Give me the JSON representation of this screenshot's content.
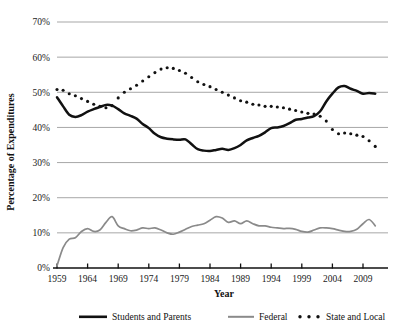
{
  "chart_data": {
    "type": "line",
    "title": "",
    "xlabel": "Year",
    "ylabel": "Percentage of Expenditures",
    "xlim": [
      1959,
      2012
    ],
    "ylim": [
      0,
      70
    ],
    "ytick_labels": [
      "0%",
      "10%",
      "20%",
      "30%",
      "40%",
      "50%",
      "60%",
      "70%"
    ],
    "ytick_values": [
      0,
      10,
      20,
      30,
      40,
      50,
      60,
      70
    ],
    "xtick_labels": [
      "1959",
      "1964",
      "1969",
      "1974",
      "1979",
      "1984",
      "1989",
      "1994",
      "1999",
      "2004",
      "2009"
    ],
    "xtick_values": [
      1959,
      1964,
      1969,
      1974,
      1979,
      1984,
      1989,
      1994,
      1999,
      2004,
      2009
    ],
    "grid": "horizontal",
    "legend_position": "bottom",
    "x": [
      1959,
      1960,
      1961,
      1962,
      1963,
      1964,
      1965,
      1966,
      1967,
      1968,
      1969,
      1970,
      1971,
      1972,
      1973,
      1974,
      1975,
      1976,
      1977,
      1978,
      1979,
      1980,
      1981,
      1982,
      1983,
      1984,
      1985,
      1986,
      1987,
      1988,
      1989,
      1990,
      1991,
      1992,
      1993,
      1994,
      1995,
      1996,
      1997,
      1998,
      1999,
      2000,
      2001,
      2002,
      2003,
      2004,
      2005,
      2006,
      2007,
      2008,
      2009,
      2010,
      2011
    ],
    "series": [
      {
        "name": "Students and Parents",
        "color": "#111111",
        "style": "solid",
        "values": [
          48.6,
          46.0,
          43.6,
          43.0,
          43.5,
          44.5,
          45.2,
          45.8,
          46.4,
          46.2,
          45.2,
          44.0,
          43.3,
          42.5,
          41.0,
          39.8,
          38.2,
          37.2,
          36.8,
          36.6,
          36.5,
          36.6,
          35.2,
          33.8,
          33.4,
          33.3,
          33.6,
          33.9,
          33.6,
          34.1,
          35.0,
          36.3,
          37.0,
          37.6,
          38.6,
          39.8,
          40.0,
          40.4,
          41.2,
          42.2,
          42.4,
          42.8,
          43.2,
          44.6,
          47.4,
          49.6,
          51.4,
          51.8,
          51.0,
          50.4,
          49.6,
          49.8,
          49.6
        ]
      },
      {
        "name": "Federal",
        "color": "#8a8a8a",
        "style": "solid",
        "values": [
          0.6,
          5.8,
          8.2,
          8.6,
          10.4,
          11.2,
          10.4,
          10.8,
          13.0,
          14.6,
          12.0,
          11.2,
          10.6,
          10.8,
          11.4,
          11.2,
          11.4,
          10.8,
          10.0,
          9.6,
          10.2,
          11.0,
          11.8,
          12.2,
          12.6,
          13.6,
          14.6,
          14.2,
          13.0,
          13.4,
          12.6,
          13.4,
          12.6,
          12.0,
          12.0,
          11.6,
          11.4,
          11.2,
          11.3,
          11.0,
          10.4,
          10.2,
          10.8,
          11.4,
          11.4,
          11.2,
          10.8,
          10.4,
          10.4,
          11.0,
          12.6,
          13.8,
          12.0
        ]
      },
      {
        "name": "State and Local",
        "color": "#111111",
        "style": "dotted",
        "values": [
          50.8,
          50.6,
          49.6,
          49.0,
          48.2,
          47.4,
          46.6,
          46.0,
          45.6,
          46.2,
          48.4,
          50.0,
          51.0,
          52.0,
          53.2,
          54.4,
          55.6,
          56.6,
          57.0,
          56.8,
          56.2,
          55.4,
          54.2,
          53.0,
          52.2,
          51.6,
          50.8,
          50.0,
          49.2,
          48.4,
          47.6,
          47.2,
          46.6,
          46.4,
          46.0,
          46.0,
          45.8,
          45.6,
          45.2,
          44.8,
          44.4,
          44.0,
          43.8,
          43.2,
          41.8,
          39.4,
          38.2,
          38.4,
          38.2,
          37.8,
          37.4,
          36.2,
          34.6
        ]
      }
    ]
  },
  "legend": {
    "items": [
      {
        "label": "Students and Parents",
        "marker": "solid-black-line"
      },
      {
        "label": "Federal",
        "marker": "solid-gray-line"
      },
      {
        "label": "State and Local",
        "marker": "dotted-black-line"
      }
    ]
  }
}
